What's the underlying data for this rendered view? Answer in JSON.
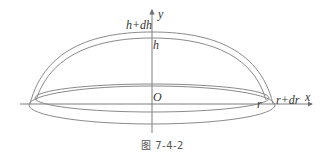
{
  "figure": {
    "caption": "图 7-4-2",
    "labels": {
      "y_axis": "y",
      "x_axis": "x",
      "origin": "O",
      "outer_height": "h+dh",
      "inner_height": "h",
      "inner_radius": "r",
      "outer_radius": "r+dr"
    },
    "colors": {
      "curve": "#8a8a8a",
      "axis": "#6e6e6e",
      "text": "#333333"
    }
  }
}
